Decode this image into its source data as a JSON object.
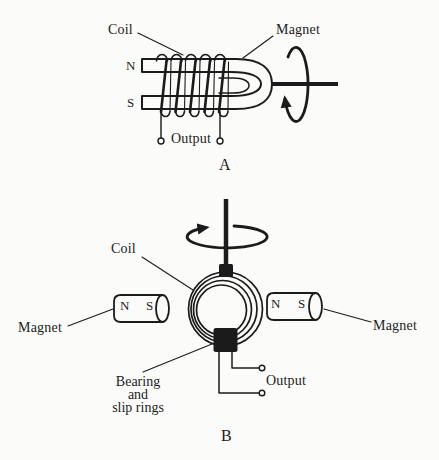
{
  "page": {
    "background": "#fbfbf9",
    "ink": "#1b1b1b"
  },
  "panel_a": {
    "coil_label": "Coil",
    "magnet_label": "Magnet",
    "pole_north": "N",
    "pole_south": "S",
    "output_label": "Output",
    "panel_label": "A"
  },
  "panel_b": {
    "coil_label": "Coil",
    "left_magnet": {
      "label": "Magnet",
      "pole_north": "N",
      "pole_south": "S"
    },
    "right_magnet": {
      "label": "Magnet",
      "pole_north": "N",
      "pole_south": "S"
    },
    "bearing_label": {
      "line1": "Bearing",
      "line2": "and",
      "line3": "slip rings"
    },
    "output_label": "Output",
    "panel_label": "B"
  }
}
